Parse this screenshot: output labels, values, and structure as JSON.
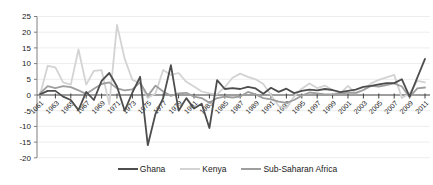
{
  "chart_data": {
    "type": "line",
    "years": [
      1961,
      1962,
      1963,
      1964,
      1965,
      1966,
      1967,
      1968,
      1969,
      1970,
      1971,
      1972,
      1973,
      1974,
      1975,
      1976,
      1977,
      1978,
      1979,
      1980,
      1981,
      1982,
      1983,
      1984,
      1985,
      1986,
      1987,
      1988,
      1989,
      1990,
      1991,
      1992,
      1993,
      1994,
      1995,
      1996,
      1997,
      1998,
      1999,
      2000,
      2001,
      2002,
      2003,
      2004,
      2005,
      2006,
      2007,
      2008,
      2009,
      2010,
      2011
    ],
    "x_tick_labels": [
      "1961",
      "1963",
      "1965",
      "1967",
      "1969",
      "1971",
      "1973",
      "1975",
      "1977",
      "1979",
      "1981",
      "1983",
      "1985",
      "1987",
      "1989",
      "1991",
      "1993",
      "1995",
      "1997",
      "1999",
      "2001",
      "2003",
      "2005",
      "2007",
      "2009",
      "2011"
    ],
    "yticks": [
      25,
      20,
      15,
      10,
      5,
      0,
      -5,
      -10,
      -15,
      -20
    ],
    "ylim": [
      -20,
      25
    ],
    "grid": true,
    "legend_position": "bottom",
    "series": [
      {
        "name": "Ghana",
        "color": "#4d4d4d",
        "values": [
          0.2,
          1.3,
          1.3,
          -0.5,
          -1.6,
          -4.8,
          1.0,
          -1.6,
          4.5,
          7.0,
          2.7,
          -5.0,
          0.8,
          5.8,
          -16.0,
          -6.0,
          -1.0,
          9.5,
          -5.0,
          -1.0,
          -4.3,
          -2.8,
          -10.5,
          4.7,
          1.9,
          2.2,
          1.9,
          2.6,
          2.1,
          0.4,
          2.3,
          1.0,
          2.0,
          0.6,
          1.3,
          1.7,
          1.5,
          1.9,
          1.6,
          0.9,
          1.3,
          1.7,
          2.6,
          2.9,
          3.4,
          3.8,
          3.8,
          5.0,
          -0.5,
          5.5,
          11.5
        ]
      },
      {
        "name": "Kenya",
        "color": "#d3d3d3",
        "values": [
          0.0,
          9.3,
          8.8,
          4.0,
          3.3,
          14.5,
          3.3,
          7.7,
          7.9,
          -3.0,
          22.3,
          11.5,
          4.8,
          3.7,
          -1.0,
          0.5,
          8.0,
          6.4,
          7.0,
          4.2,
          2.7,
          1.1,
          0.5,
          0.3,
          2.5,
          5.5,
          6.8,
          5.8,
          5.0,
          3.5,
          0.0,
          -3.5,
          -4.2,
          -0.5,
          2.0,
          3.7,
          2.2,
          3.0,
          1.5,
          0.5,
          2.9,
          0.5,
          1.6,
          3.7,
          4.8,
          5.6,
          6.4,
          -1.0,
          0.5,
          4.5,
          4.0
        ]
      },
      {
        "name": "Sub-Saharan Africa",
        "color": "#9e9e9e",
        "values": [
          0.5,
          2.8,
          2.2,
          2.8,
          2.5,
          1.5,
          0.3,
          2.0,
          3.5,
          4.0,
          2.1,
          1.5,
          1.8,
          4.0,
          -0.3,
          3.0,
          1.1,
          -0.3,
          0.5,
          0.7,
          -0.5,
          -1.0,
          -2.5,
          -1.0,
          -0.5,
          -0.8,
          -0.5,
          1.0,
          0.2,
          -1.0,
          -1.4,
          -2.1,
          -2.5,
          -1.6,
          -0.2,
          0.8,
          0.5,
          0.2,
          0.2,
          0.5,
          0.7,
          0.7,
          1.6,
          2.9,
          2.7,
          3.2,
          3.7,
          2.7,
          -0.7,
          2.1,
          2.4
        ]
      }
    ],
    "colors": {
      "grid": "#ededed",
      "zero_line": "#3f3f3f",
      "axis": "#7f7f7f",
      "text": "#1a1a1a"
    }
  }
}
